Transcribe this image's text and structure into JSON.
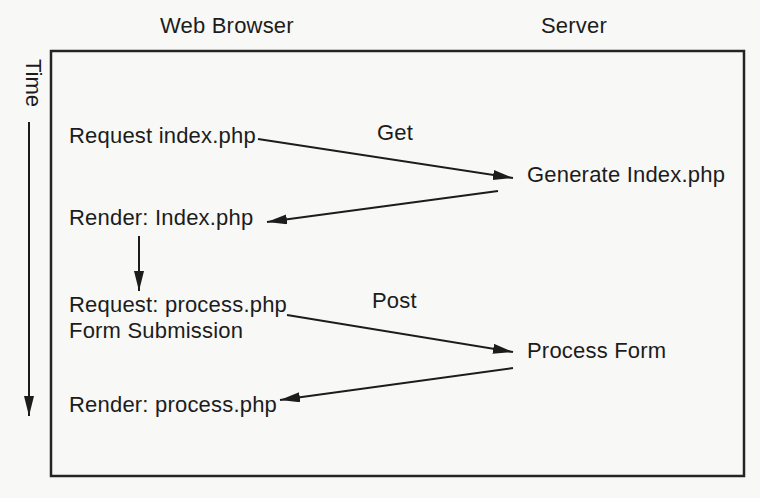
{
  "diagram": {
    "participants": {
      "browser": "Web Browser",
      "server": "Server"
    },
    "time_axis": {
      "label": "Time"
    },
    "browser_steps": {
      "request_index": "Request index.php",
      "render_index": "Render: Index.php",
      "request_process_line1": "Request: process.php",
      "request_process_line2": "Form Submission",
      "render_process": "Render: process.php"
    },
    "server_steps": {
      "generate_index": "Generate Index.php",
      "process_form": "Process Form"
    },
    "messages": {
      "get_label": "Get",
      "post_label": "Post"
    },
    "colors": {
      "ink": "#1c1c1c",
      "paper": "#f8f8f6"
    }
  }
}
